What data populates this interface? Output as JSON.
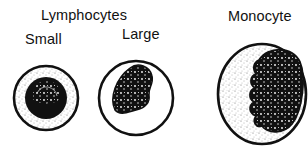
{
  "diagram": {
    "group_title": "Lymphocytes",
    "cells": [
      {
        "label": "Small",
        "type": "small-lymphocyte"
      },
      {
        "label": "Large",
        "type": "large-lymphocyte"
      },
      {
        "label": "Monocyte",
        "type": "monocyte"
      }
    ],
    "colors": {
      "ink": "#111111",
      "background": "#ffffff",
      "stipple": "#555555"
    }
  }
}
